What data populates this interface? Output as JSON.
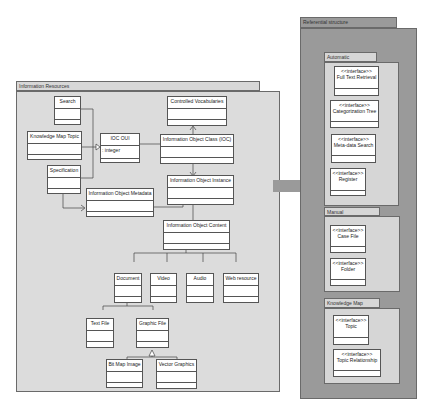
{
  "packages": {
    "information_resources": {
      "title": "Information Resources",
      "classes": {
        "search": {
          "name": "Search"
        },
        "knowledge_map_topic": {
          "name": "Knowledge Map Topic"
        },
        "specification": {
          "name": "Specification"
        },
        "ioc_oui": {
          "name": "IOC OUI",
          "attribute": ": integer"
        },
        "controlled_vocabularies": {
          "name": "Controlled Vocabularies"
        },
        "information_object_class": {
          "name": "Information Object Class (IOC)"
        },
        "information_object_instance": {
          "name": "Information Object Instance"
        },
        "information_object_metadata": {
          "name": "Information Object Metadata"
        },
        "information_object_content": {
          "name": "Information Object Content"
        },
        "document": {
          "name": "Document"
        },
        "video": {
          "name": "Video"
        },
        "audio": {
          "name": "Audio"
        },
        "web_resource": {
          "name": "Web resource"
        },
        "text_file": {
          "name": "Text File"
        },
        "graphic_file": {
          "name": "Graphic File"
        },
        "bit_map_image": {
          "name": "Bit Map Image"
        },
        "vector_graphics": {
          "name": "Vector Graphics"
        }
      }
    },
    "referential_structure": {
      "title": "Referential structure",
      "subpackages": {
        "automatic": {
          "title": "Automatic",
          "interfaces": [
            {
              "stereotype": "<<interface>>",
              "name": "Full Text Retrieval"
            },
            {
              "stereotype": "<<interface>>",
              "name": "Categorization Tree"
            },
            {
              "stereotype": "<<interface>>",
              "name": "Meta-data Search"
            },
            {
              "stereotype": "<<interface>>",
              "name": "Register"
            }
          ]
        },
        "manual": {
          "title": "Manual",
          "interfaces": [
            {
              "stereotype": "<<interface>>",
              "name": "Case File"
            },
            {
              "stereotype": "<<interface>>",
              "name": "Folder"
            }
          ]
        },
        "knowledge_map": {
          "title": "Knowledge Map",
          "interfaces": [
            {
              "stereotype": "<<interface>>",
              "name": "Topic"
            },
            {
              "stereotype": "<<interface>>",
              "name": "Topic Relationship"
            }
          ]
        }
      }
    }
  },
  "colors": {
    "information_resources_fill": "#dcdcdc",
    "referential_structure_fill": "#9a9a9a",
    "subpackage_fill": "#d6d6d6",
    "connector_block": "#9a9a9a"
  }
}
